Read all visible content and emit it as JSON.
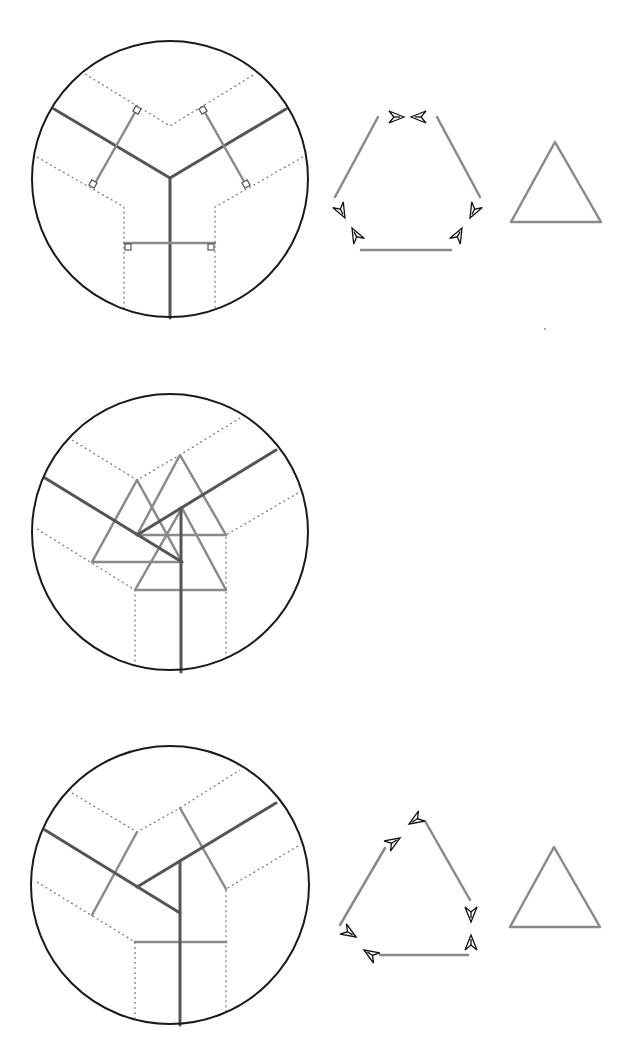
{
  "figure": {
    "colors": {
      "background": "#ffffff",
      "circle_outline": "#1a1a1a",
      "dark_line": "#555555",
      "light_line": "#8a8a8a",
      "dotted_line": "#777777",
      "arrow_outline": "#111111"
    },
    "panels": [
      {
        "id": "panel-1",
        "circle": {
          "cx": 170,
          "cy": 179,
          "r": 138
        },
        "content": "Y-junction with perpendicular bisectors and right-angle marks",
        "hexagon": {
          "vertices": [
            [
              378,
              117
            ],
            [
              437,
              117
            ],
            [
              482,
              200
            ],
            [
              451,
              250
            ],
            [
              361,
              250
            ],
            [
              332,
              200
            ]
          ],
          "arrow_count": 6
        },
        "triangle": {
          "apex": [
            555,
            142
          ],
          "base": [
            [
              511,
              222
            ],
            [
              601,
              222
            ]
          ]
        }
      },
      {
        "id": "panel-2",
        "circle": {
          "cx": 170,
          "cy": 532,
          "r": 138
        },
        "content": "Three overlapping equilateral triangles composing a displaced junction"
      },
      {
        "id": "panel-3",
        "circle": {
          "cx": 170,
          "cy": 885,
          "r": 139
        },
        "content": "Displaced junction with three arms and perpendicular segments",
        "loop": {
          "vertices": [
            [
              384,
              820
            ],
            [
              422,
              820
            ],
            [
              471,
              900
            ],
            [
              468,
              952
            ],
            [
              380,
              955
            ],
            [
              340,
              935
            ]
          ],
          "arrow_count": 6
        },
        "triangle": {
          "apex": [
            554,
            847
          ],
          "base": [
            [
              510,
              927
            ],
            [
              600,
              927
            ]
          ]
        }
      }
    ],
    "labels": []
  }
}
